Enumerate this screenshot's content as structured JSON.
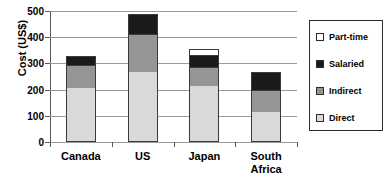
{
  "chart_data": {
    "type": "bar",
    "subtype": "stacked-vertical",
    "title": "",
    "xlabel": "",
    "ylabel": "Cost (US$)",
    "ylim": [
      0,
      500
    ],
    "ytick_values": [
      500,
      400,
      300,
      200,
      100,
      0
    ],
    "ytick_labels": [
      "500",
      "400",
      "300",
      "200",
      "100",
      "0"
    ],
    "grid": true,
    "grid_axis": "y",
    "legend_position": "right",
    "categories": [
      "Canada",
      "US",
      "Japan",
      "South Africa"
    ],
    "category_label_lines": [
      [
        "Canada"
      ],
      [
        "US"
      ],
      [
        "Japan"
      ],
      [
        "South",
        "Africa"
      ]
    ],
    "series": [
      {
        "name": "Direct",
        "color": "#d9d9d9",
        "values": [
          205,
          268,
          212,
          115
        ]
      },
      {
        "name": "Indirect",
        "color": "#969696",
        "values": [
          90,
          143,
          75,
          85
        ]
      },
      {
        "name": "Salaried",
        "color": "#1a1a1a",
        "values": [
          35,
          78,
          47,
          67
        ]
      },
      {
        "name": "Part-time",
        "color": "#ffffff",
        "values": [
          0,
          0,
          20,
          0
        ]
      }
    ],
    "totals": [
      330,
      489,
      354,
      267
    ],
    "legend_entries": [
      {
        "label": "Part-time",
        "color": "#ffffff"
      },
      {
        "label": "Salaried",
        "color": "#1a1a1a"
      },
      {
        "label": "Indirect",
        "color": "#969696"
      },
      {
        "label": "Direct",
        "color": "#d9d9d9"
      }
    ]
  }
}
